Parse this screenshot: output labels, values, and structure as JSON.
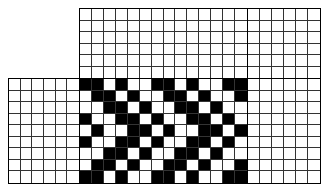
{
  "diagram": {
    "type": "weaving-draft",
    "cell_size_px": [
      12,
      11.7
    ],
    "colors": {
      "filled": "#000000",
      "empty": "#ffffff",
      "grid_line": "#333333"
    },
    "sections": {
      "threading": {
        "cols": 14,
        "rows": 6,
        "filled": []
      },
      "tieup_area": {
        "cols": 6,
        "rows": 6,
        "filled": []
      },
      "treadling": {
        "cols": 6,
        "rows": 9,
        "filled": []
      },
      "right_blank": {
        "cols": 6,
        "rows": 9,
        "filled": []
      },
      "drawdown": {
        "cols": 14,
        "rows": 9,
        "pattern": [
          "BBWBWWBBWBWWBB",
          "WBBWBWWBBWBWWB",
          "WWBBWBWWBBWBWW",
          "BWWBBWBWWBBWBW",
          "WBWWBBWBWWBBWB",
          "BWWBBWBWWBBWBW",
          "WWBBWBWWBBWBWW",
          "WBBWBWWBBWBWWB",
          "BBWBWWBBWBWWBB"
        ]
      }
    }
  }
}
